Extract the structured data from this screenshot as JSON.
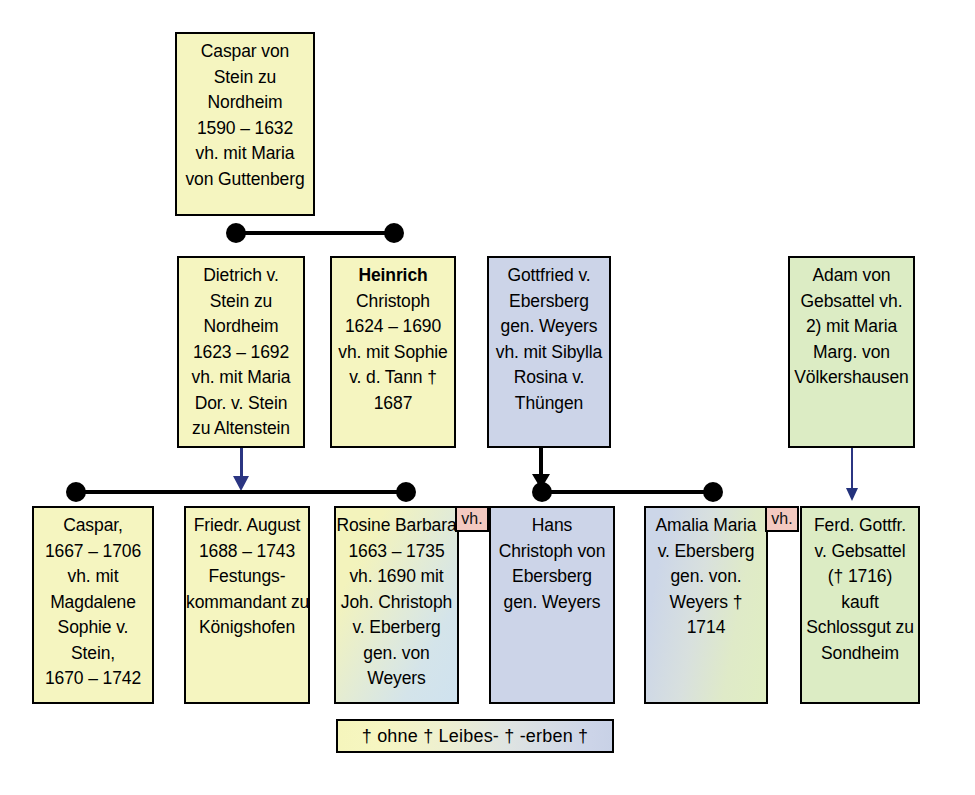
{
  "diagram": {
    "colors": {
      "yellow": "#f5f5c0",
      "blue": "#ccd4e8",
      "green": "#dcecc4",
      "pink_tab": "#f3c9c0",
      "connector_black": "#000000",
      "arrow_navy": "#2b3582",
      "background": "#ffffff"
    }
  },
  "nodes": {
    "caspar_von_stein": {
      "fill": "yellow",
      "lines": [
        "Caspar von",
        "Stein zu",
        "Nordheim",
        "1590 – 1632",
        "vh. mit Maria",
        "von Guttenberg"
      ]
    },
    "dietrich_von_stein": {
      "fill": "yellow",
      "lines": [
        "Dietrich v.",
        "Stein zu",
        "Nordheim",
        "1623 – 1692",
        "vh. mit Maria",
        "Dor. v. Stein",
        "zu Altenstein"
      ]
    },
    "heinrich_christoph": {
      "fill": "yellow",
      "bold_first_line": true,
      "lines": [
        "Heinrich",
        "Christoph",
        "1624 – 1690",
        "vh. mit Sophie",
        "v. d. Tann  †",
        "1687"
      ]
    },
    "gottfried_von_ebersberg": {
      "fill": "blue",
      "lines": [
        "Gottfried v.",
        "Ebersberg",
        "gen. Weyers",
        "vh. mit Sibylla",
        "Rosina v.",
        "Thüngen"
      ]
    },
    "adam_von_gebsattel": {
      "fill": "green",
      "lines": [
        "Adam von",
        "Gebsattel vh.",
        "2) mit Maria",
        "Marg. von",
        "Völkershausen"
      ]
    },
    "caspar_1667": {
      "fill": "yellow",
      "lines": [
        "Caspar,",
        "1667 – 1706",
        "vh. mit",
        "Magdalene",
        "Sophie v.",
        "Stein,",
        "1670 – 1742"
      ]
    },
    "friedr_august": {
      "fill": "yellow",
      "lines": [
        "Friedr. August",
        "1688 – 1743",
        "Festungs-",
        "kommandant zu",
        "Königshofen"
      ]
    },
    "rosine_barbara": {
      "fill": "gradient-yellow-blue",
      "tab_label": "vh.",
      "lines": [
        "Rosine Barbara",
        "1663 – 1735",
        "vh. 1690 mit",
        "Joh. Christoph",
        "v. Eberberg",
        "gen. von",
        "Weyers"
      ]
    },
    "hans_christoph": {
      "fill": "blue",
      "lines": [
        "Hans",
        "Christoph von",
        "Ebersberg",
        "gen. Weyers"
      ]
    },
    "amalia_maria": {
      "fill": "gradient-blue-green",
      "tab_label": "vh.",
      "lines": [
        "Amalia Maria",
        "v. Ebersberg",
        "gen. von.",
        "Weyers †",
        "1714"
      ]
    },
    "ferd_gottfr": {
      "fill": "green",
      "lines": [
        "Ferd. Gottfr.",
        "v. Gebsattel",
        "(† 1716)",
        "kauft",
        "Schlossgut zu",
        "Sondheim"
      ]
    }
  },
  "legend": {
    "text": "† ohne † Leibes- † -erben †"
  }
}
